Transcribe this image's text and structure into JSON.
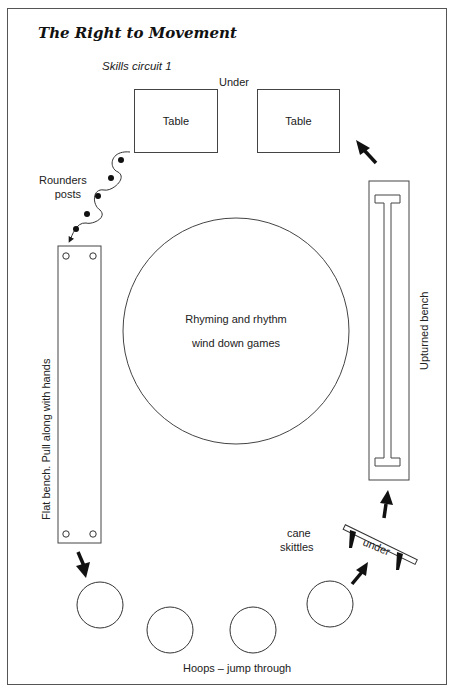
{
  "title": "The Right to Movement",
  "subtitle": "Skills circuit 1",
  "stations": {
    "tables": {
      "caption": "Under",
      "left_label": "Table",
      "right_label": "Table"
    },
    "rounders_posts": {
      "label_line1": "Rounders",
      "label_line2": "posts",
      "post_count": 5
    },
    "flat_bench": {
      "label": "Flat bench. Pull along with hands"
    },
    "upturned_bench": {
      "label": "Upturned bench"
    },
    "cane_skittles": {
      "label_line1": "cane",
      "label_line2": "skittles",
      "under_label": "under"
    },
    "hoops": {
      "label": "Hoops – jump through",
      "count": 4
    },
    "centre": {
      "line1": "Rhyming and rhythm",
      "line2": "wind down games"
    }
  },
  "colors": {
    "ink": "#1a1a1a",
    "line": "#444444",
    "background": "#ffffff"
  }
}
